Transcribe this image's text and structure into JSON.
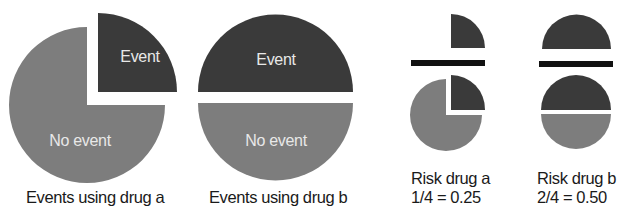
{
  "colors": {
    "event": "#3a3a3a",
    "no_event": "#7d7d7d",
    "fraction_bar": "#111111",
    "background": "#ffffff"
  },
  "panels": [
    {
      "id": "events-drug-a",
      "caption": "Events using drug a",
      "segments": [
        {
          "label": "Event",
          "fraction": 0.25
        },
        {
          "label": "No event",
          "fraction": 0.75
        }
      ]
    },
    {
      "id": "events-drug-b",
      "caption": "Events using drug b",
      "segments": [
        {
          "label": "Event",
          "fraction": 0.5
        },
        {
          "label": "No event",
          "fraction": 0.5
        }
      ]
    },
    {
      "id": "risk-drug-a",
      "caption": "Risk drug a",
      "formula": "1/4 = 0.25",
      "numerator": "events (1/4 of pie)",
      "denominator": "all patients (whole pie)"
    },
    {
      "id": "risk-drug-b",
      "caption": "Risk drug b",
      "formula": "2/4 = 0.50",
      "numerator": "events (2/4 of pie)",
      "denominator": "all patients (whole pie)"
    }
  ]
}
